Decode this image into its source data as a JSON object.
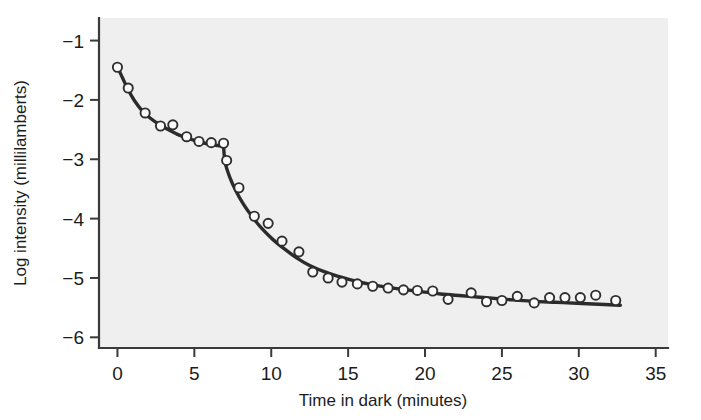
{
  "chart_data": {
    "type": "scatter",
    "title": "",
    "xlabel": "Time in dark (minutes)",
    "ylabel": "Log intensity (millilamberts)",
    "xlim": [
      -1.2,
      35.8
    ],
    "ylim": [
      -6.18,
      -0.62
    ],
    "xticks": [
      0,
      5,
      10,
      15,
      20,
      25,
      30,
      35
    ],
    "xtick_labels": [
      "0",
      "5",
      "10",
      "15",
      "20",
      "25",
      "30",
      "35"
    ],
    "yticks": [
      -1,
      -2,
      -3,
      -4,
      -5,
      -6
    ],
    "ytick_labels": [
      "−1",
      "−2",
      "−3",
      "−4",
      "−5",
      "−6"
    ],
    "grid": false,
    "legend": null,
    "plot_background_color": "#efefef",
    "curve_color": "#2b2b2b",
    "marker_face_color": "#fafafa",
    "marker_edge_color": "#2e2e2e",
    "marker_radius_px": 4.6,
    "annotations": [
      {
        "name": "rod-cone-break",
        "x": 6.9,
        "y": -2.8
      }
    ],
    "series": [
      {
        "name": "Dark adaptation threshold (observed)",
        "marker": "open-circle",
        "x": [
          0.0,
          0.7,
          1.8,
          2.8,
          3.6,
          4.5,
          5.3,
          6.1,
          6.9,
          7.1,
          7.9,
          8.9,
          9.8,
          10.7,
          11.8,
          12.7,
          13.7,
          14.6,
          15.6,
          16.6,
          17.6,
          18.6,
          19.5,
          20.5,
          21.5,
          23.0,
          24.0,
          25.0,
          26.0,
          27.1,
          28.1,
          29.1,
          30.1,
          31.1,
          32.4
        ],
        "y": [
          -1.45,
          -1.8,
          -2.22,
          -2.44,
          -2.42,
          -2.62,
          -2.7,
          -2.72,
          -2.73,
          -3.02,
          -3.48,
          -3.96,
          -4.08,
          -4.38,
          -4.56,
          -4.9,
          -5.0,
          -5.07,
          -5.1,
          -5.14,
          -5.17,
          -5.2,
          -5.21,
          -5.22,
          -5.36,
          -5.25,
          -5.4,
          -5.38,
          -5.31,
          -5.42,
          -5.33,
          -5.33,
          -5.33,
          -5.29,
          -5.38
        ]
      }
    ],
    "fit_curve": {
      "name": "Fitted two-branch dark adaptation curve",
      "branches": [
        {
          "name": "cone-branch",
          "x": [
            0.0,
            0.35,
            0.7,
            1.1,
            1.6,
            2.1,
            2.7,
            3.3,
            3.9,
            4.5,
            5.1,
            5.7,
            6.3,
            6.9
          ],
          "y": [
            -1.44,
            -1.64,
            -1.83,
            -2.01,
            -2.18,
            -2.3,
            -2.41,
            -2.5,
            -2.58,
            -2.64,
            -2.69,
            -2.73,
            -2.76,
            -2.78
          ]
        },
        {
          "name": "rod-branch",
          "x": [
            6.9,
            7.0,
            7.3,
            7.7,
            8.2,
            8.8,
            9.4,
            10.1,
            10.9,
            11.7,
            12.5,
            13.4,
            14.3,
            15.3,
            16.3,
            17.4,
            18.5,
            19.7,
            21.0,
            22.4,
            23.8,
            25.3,
            26.9,
            28.5,
            30.2,
            32.7
          ],
          "y": [
            -2.78,
            -3.05,
            -3.3,
            -3.53,
            -3.76,
            -3.98,
            -4.17,
            -4.35,
            -4.52,
            -4.67,
            -4.79,
            -4.89,
            -4.97,
            -5.04,
            -5.1,
            -5.15,
            -5.19,
            -5.23,
            -5.27,
            -5.3,
            -5.33,
            -5.36,
            -5.39,
            -5.41,
            -5.43,
            -5.46
          ]
        }
      ]
    }
  }
}
